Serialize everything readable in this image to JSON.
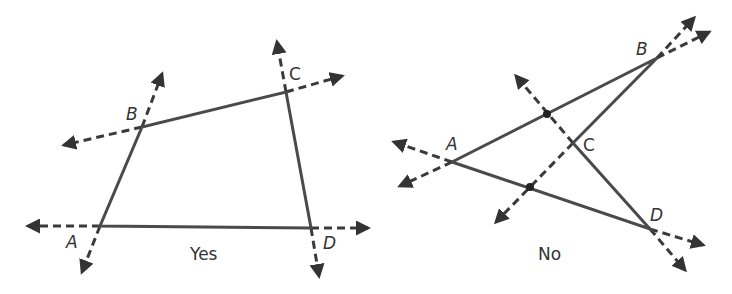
{
  "figures": [
    {
      "id": "convex",
      "caption": "Yes",
      "vertices": {
        "A": {
          "label": "A",
          "x": 100,
          "y": 226
        },
        "B": {
          "label": "B",
          "x": 142,
          "y": 127
        },
        "C": {
          "label": "C",
          "x": 286,
          "y": 92
        },
        "D": {
          "label": "D",
          "x": 311,
          "y": 228
        }
      }
    },
    {
      "id": "non-convex",
      "caption": "No",
      "vertices": {
        "A": {
          "label": "A",
          "x": 452,
          "y": 162
        },
        "B": {
          "label": "B",
          "x": 657,
          "y": 58
        },
        "C": {
          "label": "C",
          "x": 573,
          "y": 143
        },
        "D": {
          "label": "D",
          "x": 650,
          "y": 229
        }
      },
      "intersection_points": [
        {
          "x": 547,
          "y": 114
        },
        {
          "x": 530,
          "y": 187
        }
      ]
    }
  ],
  "colors": {
    "line": "#4a4a4a",
    "text": "#333333",
    "background": "#ffffff"
  }
}
